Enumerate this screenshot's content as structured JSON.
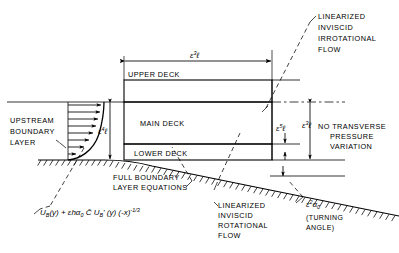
{
  "figure": {
    "background_color": "#ffffff",
    "line_color": "#000000"
  },
  "labels": {
    "upper_deck": "UPPER DECK",
    "main_deck": "MAIN DECK",
    "lower_deck": "LOWER DECK",
    "upstream_boundary_layer_l1": "UPSTREAM",
    "upstream_boundary_layer_l2": "BOUNDARY",
    "upstream_boundary_layer_l3": "LAYER",
    "linearized_inviscid_irrotational_l1": "LINEARIZED",
    "linearized_inviscid_irrotational_l2": "INVISCID",
    "linearized_inviscid_irrotational_l3": "IRROTATIONAL",
    "linearized_inviscid_irrotational_l4": "FLOW",
    "linearized_inviscid_rotational_l1": "LINEARIZED",
    "linearized_inviscid_rotational_l2": "INVISCID",
    "linearized_inviscid_rotational_l3": "ROTATIONAL",
    "linearized_inviscid_rotational_l4": "FLOW",
    "full_boundary_layer_l1": "FULL BOUNDARY",
    "full_boundary_layer_l2": "LAYER EQUATIONS",
    "no_transverse_l1": "NO TRANSVERSE",
    "no_transverse_l2": "PRESSURE",
    "no_transverse_l3": "VARIATION",
    "turning_angle_l1": "(TURNING",
    "turning_angle_l2": "ANGLE)"
  },
  "dimensions": {
    "horizontal_extent": {
      "base": "ε",
      "exponent": "3",
      "symbol": "ℓ"
    },
    "main_deck_height": {
      "base": "ε",
      "exponent": "4",
      "symbol": "ℓ"
    },
    "lower_deck_height": {
      "base": "ε",
      "exponent": "5",
      "symbol": "ℓ"
    },
    "upper_deck_height": {
      "base": "ε",
      "exponent": "3",
      "symbol": "ℓ"
    }
  },
  "turning_angle_symbol": {
    "base": "ε",
    "exponent": "2",
    "variable": "α",
    "subscript": "0"
  },
  "velocity_profile_formula": {
    "term1_fn": "U",
    "term1_sub": "B",
    "term1_arg": "(y)",
    "plus": "+",
    "term2_eps": "ε",
    "term2_h": "h",
    "term2_a": "α",
    "term2_a_sub": "0",
    "term2_cbar": "C̄",
    "term2_fn": "U",
    "term2_sub": "B",
    "term2_prime": "'",
    "term2_arg": "(y)",
    "term2_paren": "(-x)",
    "term2_exp": "-1/3",
    "full_text": "U_B(y) + εhα₀ C̄ U_B'(y) (-x)^(-1/3)"
  }
}
